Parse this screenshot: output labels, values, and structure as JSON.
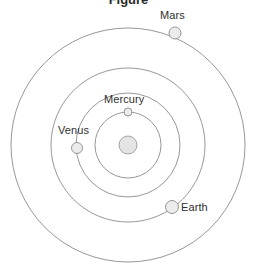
{
  "figure": {
    "title_fragment": "Figure",
    "background_color": "#ffffff",
    "width": 257,
    "height": 280
  },
  "chart_data": {
    "type": "scatter",
    "title": "",
    "xlabel": "",
    "ylabel": "",
    "subtitle": "",
    "grid": false,
    "legend": "none",
    "center": {
      "name": "Sun",
      "label": "",
      "cx": 128,
      "cy": 145,
      "radius": 9,
      "fill_color": "#e4e4e4",
      "stroke_color": "#9a9a9a"
    },
    "orbit_stroke_color": "#8b8b8b",
    "planet_fill_color": "#ececec",
    "label_color": "#2f2f2f",
    "orbits": [
      {
        "planet": "Mercury",
        "label": "Mercury",
        "orbit_radius": 33,
        "planet_cx": 128,
        "planet_cy": 112,
        "planet_radius": 4,
        "label_x": 104,
        "label_y": 93,
        "angle_deg": 90
      },
      {
        "planet": "Venus",
        "label": "Venus",
        "orbit_radius": 52,
        "planet_cx": 77,
        "planet_cy": 148,
        "planet_radius": 5.5,
        "label_x": 58,
        "label_y": 124,
        "angle_deg": 183
      },
      {
        "planet": "Earth",
        "label": "Earth",
        "orbit_radius": 77,
        "planet_cx": 172,
        "planet_cy": 207,
        "planet_radius": 6.5,
        "label_x": 181,
        "label_y": 201,
        "angle_deg": 303
      },
      {
        "planet": "Mars",
        "label": "Mars",
        "orbit_radius": 117,
        "planet_cx": 175,
        "planet_cy": 33,
        "planet_radius": 6,
        "label_x": 160,
        "label_y": 9,
        "angle_deg": 64
      }
    ]
  }
}
